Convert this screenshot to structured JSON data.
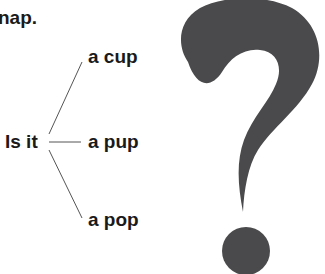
{
  "text": {
    "fragment": "nap.",
    "stem": "Is it",
    "options": [
      "a cup",
      "a pup",
      "a pop"
    ]
  },
  "icons": {
    "question_mark": "question-mark-icon"
  },
  "colors": {
    "text": "#1a1a1a",
    "lines": "#555555",
    "question_mark": "#4a4a4c",
    "background": "#ffffff"
  }
}
